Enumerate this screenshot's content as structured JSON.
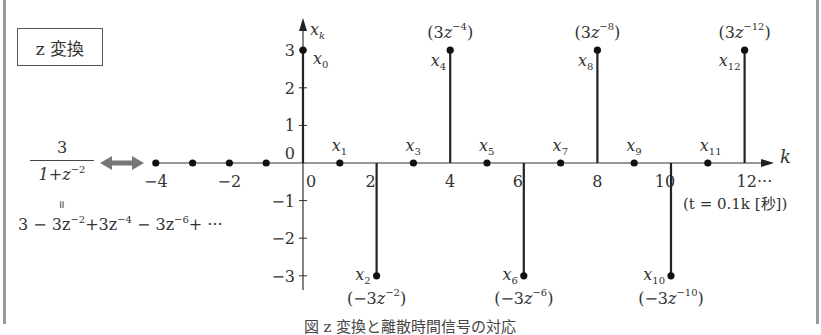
{
  "title_box": {
    "label": "z 変換"
  },
  "left_formula": {
    "numerator": "3",
    "denominator_base": "1+z",
    "denominator_exp": "−2",
    "equals_sign": "॥",
    "series_terms": [
      {
        "text": "3 − 3z",
        "exp": "−2"
      },
      {
        "text": "+3z",
        "exp": "−4"
      },
      {
        "text": " − 3z",
        "exp": "−6"
      },
      {
        "text": "+ ···",
        "exp": ""
      }
    ],
    "arrow_color": "#777777"
  },
  "chart_data": {
    "type": "stem",
    "title": "z 変換",
    "xlabel": "k",
    "ylabel": "x_k",
    "x_axis_note": "(t = 0.1k [秒])",
    "x_tick_labels": [
      "−4",
      "−2",
      "0",
      "2",
      "4",
      "6",
      "8",
      "10",
      "12···"
    ],
    "x_ticks": [
      -4,
      -2,
      0,
      2,
      4,
      6,
      8,
      10,
      12
    ],
    "y_ticks": [
      3,
      2,
      1,
      0,
      -1,
      -2,
      -3
    ],
    "y_tick_labels": [
      "3",
      "2",
      "1",
      "0",
      "−1",
      "−2",
      "−3"
    ],
    "ylim": [
      -3,
      3
    ],
    "xlim": [
      -4,
      12
    ],
    "k": [
      -4,
      -3,
      -2,
      -1,
      0,
      1,
      2,
      3,
      4,
      5,
      6,
      7,
      8,
      9,
      10,
      11,
      12
    ],
    "values": [
      0,
      0,
      0,
      0,
      3,
      0,
      -3,
      0,
      3,
      0,
      -3,
      0,
      3,
      0,
      -3,
      0,
      3
    ],
    "point_labels": [
      {
        "k": 0,
        "name": "x",
        "sub": "0",
        "term": ""
      },
      {
        "k": 1,
        "name": "x",
        "sub": "1",
        "term": ""
      },
      {
        "k": 2,
        "name": "x",
        "sub": "2",
        "term": "(−3z",
        "term_exp": "−2"
      },
      {
        "k": 3,
        "name": "x",
        "sub": "3",
        "term": ""
      },
      {
        "k": 4,
        "name": "x",
        "sub": "4",
        "term": "(3z",
        "term_exp": "−4"
      },
      {
        "k": 5,
        "name": "x",
        "sub": "5",
        "term": ""
      },
      {
        "k": 6,
        "name": "x",
        "sub": "6",
        "term": "(−3z",
        "term_exp": "−6"
      },
      {
        "k": 7,
        "name": "x",
        "sub": "7",
        "term": ""
      },
      {
        "k": 8,
        "name": "x",
        "sub": "8",
        "term": "(3z",
        "term_exp": "−8"
      },
      {
        "k": 9,
        "name": "x",
        "sub": "9",
        "term": ""
      },
      {
        "k": 10,
        "name": "x",
        "sub": "10",
        "term": "(−3z",
        "term_exp": "−10"
      },
      {
        "k": 11,
        "name": "x",
        "sub": "11",
        "term": ""
      },
      {
        "k": 12,
        "name": "x",
        "sub": "12",
        "term": "(3z",
        "term_exp": "−12"
      }
    ]
  },
  "caption": {
    "text": "図 z 変換と離散時間信号の対応"
  }
}
